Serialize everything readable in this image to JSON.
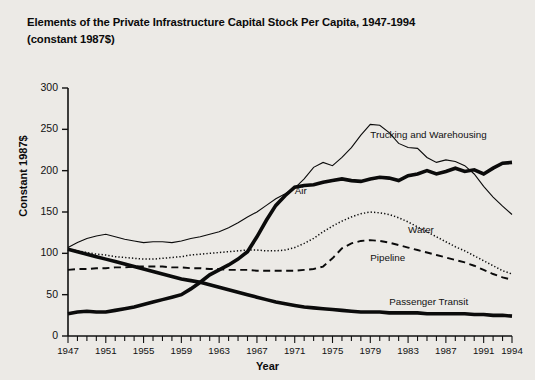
{
  "title": "Elements of the Private Infrastructure Capital Stock Per Capita, 1947-1994\n(constant 1987$)",
  "axes": {
    "xlabel": "Year",
    "ylabel": "Constant 1987$"
  },
  "chart_data": {
    "type": "line",
    "title": "Elements of the Private Infrastructure Capital Stock Per Capita, 1947-1994 (constant 1987$)",
    "xlabel": "Year",
    "ylabel": "Constant 1987$",
    "xlim": [
      1947,
      1994
    ],
    "ylim": [
      0,
      300
    ],
    "yticks": [
      0,
      50,
      100,
      150,
      200,
      250,
      300
    ],
    "ytick_labels": [
      "0",
      "50",
      "100",
      "150",
      "200",
      "250",
      "300"
    ],
    "xticks": [
      1947,
      1951,
      1955,
      1959,
      1963,
      1967,
      1971,
      1975,
      1979,
      1983,
      1987,
      1991,
      1994
    ],
    "xtick_labels": [
      "1947",
      "1951",
      "1955",
      "1959",
      "1963",
      "1967",
      "1971",
      "1975",
      "1979",
      "1983",
      "1987",
      "1991",
      "1994"
    ],
    "xtick_minor_step": 1,
    "grid": false,
    "legend": "inline-labels",
    "x": [
      1947,
      1948,
      1949,
      1950,
      1951,
      1952,
      1953,
      1954,
      1955,
      1956,
      1957,
      1958,
      1959,
      1960,
      1961,
      1962,
      1963,
      1964,
      1965,
      1966,
      1967,
      1968,
      1969,
      1970,
      1971,
      1972,
      1973,
      1974,
      1975,
      1976,
      1977,
      1978,
      1979,
      1980,
      1981,
      1982,
      1983,
      1984,
      1985,
      1986,
      1987,
      1988,
      1989,
      1990,
      1991,
      1992,
      1993,
      1994
    ],
    "series": [
      {
        "name": "Trucking and Warehousing",
        "style": "thin-solid",
        "label_position": {
          "x": 1979,
          "y": 243
        },
        "values": [
          107,
          113,
          118,
          121,
          123,
          120,
          117,
          115,
          113,
          114,
          114,
          113,
          115,
          118,
          120,
          123,
          126,
          131,
          137,
          144,
          150,
          158,
          166,
          172,
          179,
          190,
          204,
          210,
          206,
          216,
          228,
          243,
          256,
          255,
          246,
          233,
          228,
          227,
          216,
          210,
          213,
          211,
          206,
          196,
          181,
          168,
          157,
          147
        ]
      },
      {
        "name": "Air",
        "style": "thick-solid",
        "label_position": {
          "x": 1971,
          "y": 175
        },
        "values": [
          27,
          29,
          30,
          29,
          29,
          31,
          33,
          35,
          38,
          41,
          44,
          47,
          50,
          57,
          65,
          74,
          80,
          86,
          93,
          102,
          120,
          140,
          158,
          170,
          180,
          182,
          183,
          186,
          188,
          190,
          188,
          187,
          190,
          192,
          191,
          188,
          194,
          196,
          200,
          196,
          199,
          203,
          199,
          201,
          196,
          203,
          209,
          210
        ]
      },
      {
        "name": "Water",
        "style": "dotted",
        "label_position": {
          "x": 1983,
          "y": 128
        },
        "values": [
          105,
          103,
          101,
          99,
          98,
          96,
          95,
          94,
          93,
          93,
          94,
          95,
          96,
          98,
          99,
          100,
          101,
          102,
          103,
          104,
          104,
          103,
          103,
          104,
          107,
          112,
          118,
          126,
          133,
          139,
          144,
          148,
          150,
          149,
          147,
          143,
          138,
          132,
          126,
          120,
          114,
          108,
          103,
          97,
          91,
          85,
          79,
          75
        ]
      },
      {
        "name": "Pipeline",
        "style": "dashed",
        "label_position": {
          "x": 1979,
          "y": 94
        },
        "values": [
          80,
          81,
          81,
          82,
          82,
          83,
          83,
          84,
          84,
          84,
          84,
          83,
          83,
          82,
          82,
          81,
          81,
          80,
          80,
          80,
          79,
          79,
          79,
          79,
          79,
          80,
          81,
          84,
          94,
          106,
          112,
          115,
          116,
          115,
          113,
          110,
          107,
          104,
          101,
          98,
          95,
          92,
          89,
          85,
          80,
          75,
          71,
          68
        ]
      },
      {
        "name": "Passenger Transit",
        "style": "thick-solid",
        "label_position": {
          "x": 1981,
          "y": 41
        },
        "values": [
          105,
          102,
          99,
          96,
          93,
          90,
          87,
          84,
          81,
          78,
          75,
          72,
          69,
          67,
          65,
          62,
          59,
          56,
          53,
          50,
          47,
          44,
          41,
          39,
          37,
          35,
          34,
          33,
          32,
          31,
          30,
          29,
          29,
          29,
          28,
          28,
          28,
          28,
          27,
          27,
          27,
          27,
          27,
          26,
          26,
          25,
          25,
          24
        ]
      }
    ]
  }
}
